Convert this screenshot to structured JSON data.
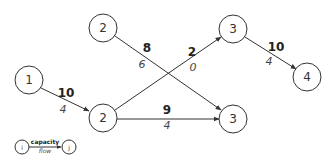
{
  "diagram": {
    "type": "flow-network",
    "nodes": [
      {
        "id": "n1",
        "label": "1"
      },
      {
        "id": "n2a",
        "label": "2"
      },
      {
        "id": "n2b",
        "label": "2"
      },
      {
        "id": "n3a",
        "label": "3"
      },
      {
        "id": "n3b",
        "label": "3"
      },
      {
        "id": "n4",
        "label": "4"
      }
    ],
    "edges": [
      {
        "from": "n1",
        "to": "n2b",
        "capacity": "10",
        "flow": "4"
      },
      {
        "from": "n2a",
        "to": "n3b",
        "capacity": "8",
        "flow": "6"
      },
      {
        "from": "n2b",
        "to": "n3a",
        "capacity": "2",
        "flow": "0"
      },
      {
        "from": "n2b",
        "to": "n3b",
        "capacity": "9",
        "flow": "4"
      },
      {
        "from": "n3a",
        "to": "n4",
        "capacity": "10",
        "flow": "4"
      }
    ],
    "legend": {
      "from_label": "i",
      "to_label": "j",
      "capacity_label": "capacity",
      "flow_label": "flow"
    },
    "colors": {
      "stroke": "#333333",
      "background": "#ffffff"
    }
  }
}
